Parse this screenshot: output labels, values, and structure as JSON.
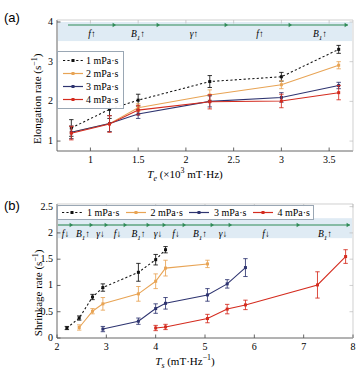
{
  "figure": {
    "colors": {
      "series1": "#111111",
      "series2": "#E8A455",
      "series3": "#2E3470",
      "series4": "#D42B1E",
      "band": "#D9E8F2",
      "arrow": "#2F8B57",
      "axis": "#000000"
    }
  },
  "panel_a": {
    "tag": "(a)",
    "legend": [
      {
        "label": "1 mPa·s",
        "color": "#111111",
        "style": "dotted"
      },
      {
        "label": "2 mPa·s",
        "color": "#E8A455",
        "style": "solid"
      },
      {
        "label": "3 mPa·s",
        "color": "#2E3470",
        "style": "solid"
      },
      {
        "label": "4 mPa·s",
        "color": "#D42B1E",
        "style": "solid"
      }
    ],
    "annotations": [
      {
        "label": "f↑",
        "base": "f",
        "arrow": "↑"
      },
      {
        "label": "B1↑",
        "base": "B",
        "sub": "1",
        "arrow": "↑"
      },
      {
        "label": "γ↑",
        "base": "γ",
        "arrow": "↑"
      },
      {
        "label": "f↑",
        "base": "f",
        "arrow": "↑"
      },
      {
        "label": "B1↑",
        "base": "B",
        "sub": "1",
        "arrow": "↑"
      }
    ],
    "chart_data": {
      "type": "line",
      "title": "",
      "xlabel": "T_e (×10³ mT·Hz)",
      "ylabel": "Elongation rate (s⁻¹)",
      "xlim": [
        0.65,
        3.75
      ],
      "ylim": [
        0.75,
        4.05
      ],
      "xticks": [
        1,
        1.5,
        2,
        2.5,
        3,
        3.5
      ],
      "xticklabels": [
        "1",
        "1.5",
        "2",
        "2.5",
        "3",
        "3.5"
      ],
      "yticks": [
        1,
        2,
        3,
        4
      ],
      "yticklabels": [
        "1",
        "2",
        "3",
        "4"
      ],
      "grid": false,
      "legend_position": "upper-left",
      "series": [
        {
          "name": "1 mPa·s",
          "color": "#111111",
          "style": "dotted",
          "x": [
            0.8,
            1.2,
            1.5,
            2.25,
            3.0,
            3.6
          ],
          "y": [
            1.33,
            1.8,
            2.03,
            2.5,
            2.62,
            3.31
          ],
          "yerr": [
            0.21,
            0.23,
            0.15,
            0.15,
            0.11,
            0.1
          ]
        },
        {
          "name": "2 mPa·s",
          "color": "#E8A455",
          "style": "solid",
          "x": [
            0.8,
            1.2,
            1.5,
            2.25,
            3.0,
            3.6
          ],
          "y": [
            1.22,
            1.44,
            1.84,
            2.16,
            2.42,
            2.91
          ],
          "yerr": [
            0.16,
            0.2,
            0.1,
            0.13,
            0.1,
            0.09
          ]
        },
        {
          "name": "3 mPa·s",
          "color": "#2E3470",
          "style": "solid",
          "x": [
            0.8,
            1.2,
            1.5,
            2.25,
            3.0,
            3.6
          ],
          "y": [
            1.22,
            1.44,
            1.68,
            2.0,
            2.1,
            2.4
          ],
          "yerr": [
            0.16,
            0.2,
            0.11,
            0.14,
            0.12,
            0.08
          ]
        },
        {
          "name": "4 mPa·s",
          "color": "#D42B1E",
          "style": "solid",
          "x": [
            0.8,
            1.2,
            1.5,
            2.25,
            3.0,
            3.6
          ],
          "y": [
            1.2,
            1.43,
            1.78,
            1.99,
            2.01,
            2.22
          ],
          "yerr": [
            0.17,
            0.21,
            0.12,
            0.18,
            0.17,
            0.18
          ]
        }
      ]
    }
  },
  "panel_b": {
    "tag": "(b)",
    "legend": [
      {
        "label": "1 mPa·s",
        "color": "#111111",
        "style": "dotted"
      },
      {
        "label": "2 mPa·s",
        "color": "#E8A455",
        "style": "solid"
      },
      {
        "label": "3 mPa·s",
        "color": "#2E3470",
        "style": "solid"
      },
      {
        "label": "4 mPa·s",
        "color": "#D42B1E",
        "style": "solid"
      }
    ],
    "annotations": [
      {
        "label": "f↓",
        "base": "f",
        "arrow": "↓"
      },
      {
        "label": "B1↑",
        "base": "B",
        "sub": "1",
        "arrow": "↑"
      },
      {
        "label": "γ↓",
        "base": "γ",
        "arrow": "↓"
      },
      {
        "label": "f↓",
        "base": "f",
        "arrow": "↓"
      },
      {
        "label": "B1↑",
        "base": "B",
        "sub": "1",
        "arrow": "↑"
      },
      {
        "label": "γ↓",
        "base": "γ",
        "arrow": "↓"
      },
      {
        "label": "f↓",
        "base": "f",
        "arrow": "↓"
      },
      {
        "label": "B1↑",
        "base": "B",
        "sub": "1",
        "arrow": "↑"
      },
      {
        "label": "γ↓",
        "base": "γ",
        "arrow": "↓"
      },
      {
        "label": "f↓",
        "base": "f",
        "arrow": "↓"
      },
      {
        "label": "B1↑",
        "base": "B",
        "sub": "1",
        "arrow": "↑"
      }
    ],
    "chart_data": {
      "type": "line",
      "title": "",
      "xlabel": "T_s (mT·Hz⁻¹)",
      "ylabel": "Shrinkage rate (s⁻¹)",
      "xlim": [
        2.0,
        8.0
      ],
      "ylim": [
        0.0,
        2.55
      ],
      "xticks": [
        2,
        3,
        4,
        5,
        6,
        7,
        8
      ],
      "xticklabels": [
        "2",
        "3",
        "4",
        "5",
        "6",
        "7",
        "8"
      ],
      "yticks": [
        0,
        0.5,
        1,
        1.5,
        2,
        2.5
      ],
      "yticklabels": [
        "0",
        "0.5",
        "1",
        "1.5",
        "2",
        "2.5"
      ],
      "grid": false,
      "legend_position": "top",
      "series": [
        {
          "name": "1 mPa·s",
          "color": "#111111",
          "style": "dotted",
          "x": [
            2.2,
            2.45,
            2.72,
            2.93,
            3.65,
            4.0,
            4.2
          ],
          "y": [
            0.19,
            0.38,
            0.78,
            0.96,
            1.25,
            1.49,
            1.68
          ],
          "yerr": [
            0.03,
            0.04,
            0.05,
            0.07,
            0.17,
            0.1,
            0.06
          ]
        },
        {
          "name": "2 mPa·s",
          "color": "#E8A455",
          "style": "solid",
          "x": [
            2.45,
            2.72,
            2.93,
            3.65,
            4.0,
            4.2,
            5.05
          ],
          "y": [
            0.2,
            0.51,
            0.65,
            0.84,
            1.08,
            1.33,
            1.41
          ],
          "yerr": [
            0.05,
            0.05,
            0.12,
            0.14,
            0.14,
            0.15,
            0.07
          ]
        },
        {
          "name": "3 mPa·s",
          "color": "#2E3470",
          "style": "solid",
          "x": [
            2.93,
            3.65,
            4.0,
            4.2,
            5.05,
            5.45,
            5.82
          ],
          "y": [
            0.17,
            0.32,
            0.56,
            0.66,
            0.82,
            1.03,
            1.34
          ],
          "yerr": [
            0.05,
            0.06,
            0.09,
            0.11,
            0.12,
            0.08,
            0.17
          ]
        },
        {
          "name": "4 mPa·s",
          "color": "#D42B1E",
          "style": "solid",
          "x": [
            4.0,
            4.2,
            5.05,
            5.45,
            5.82,
            7.28,
            7.85
          ],
          "y": [
            0.19,
            0.21,
            0.37,
            0.55,
            0.63,
            1.01,
            1.55
          ],
          "yerr": [
            0.05,
            0.05,
            0.08,
            0.09,
            0.09,
            0.25,
            0.13
          ]
        }
      ]
    }
  }
}
